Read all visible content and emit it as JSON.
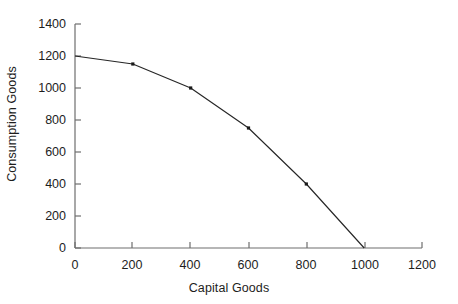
{
  "chart_data": {
    "type": "line",
    "title": "",
    "xlabel": "Capital Goods",
    "ylabel": "Consumption Goods",
    "x": [
      0,
      200,
      400,
      600,
      800,
      1000
    ],
    "values": [
      1200,
      1150,
      1000,
      750,
      400,
      0
    ],
    "series": [
      {
        "name": "Production Possibilities Frontier",
        "values": [
          1200,
          1150,
          1000,
          750,
          400,
          0
        ]
      }
    ],
    "xlim": [
      0,
      1200
    ],
    "ylim": [
      0,
      1400
    ],
    "xticks": [
      "0",
      "200",
      "400",
      "600",
      "800",
      "1000",
      "1200"
    ],
    "yticks": [
      "0",
      "200",
      "400",
      "600",
      "800",
      "1000",
      "1200",
      "1400"
    ],
    "xtick_values": [
      0,
      200,
      400,
      600,
      800,
      1000,
      1200
    ],
    "ytick_values": [
      0,
      200,
      400,
      600,
      800,
      1000,
      1200,
      1400
    ],
    "grid": false,
    "legend": "none",
    "marker": "square",
    "line_color": "#262626",
    "axis_color": "#6e6e6e",
    "marker_color": "#1a1a1a",
    "background": "#ffffff"
  }
}
